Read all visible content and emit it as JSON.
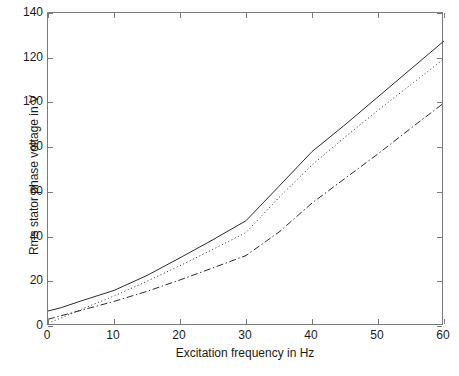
{
  "chart_data": {
    "type": "line",
    "title": "",
    "xlabel": "Excitation frequency in Hz",
    "ylabel": "Rms stator phase voltage in V",
    "xlim": [
      0,
      60
    ],
    "ylim": [
      0,
      140
    ],
    "xticks": [
      0,
      10,
      20,
      30,
      40,
      50,
      60
    ],
    "yticks": [
      0,
      20,
      40,
      60,
      80,
      100,
      120,
      140
    ],
    "grid": false,
    "legend": "none",
    "x": [
      0,
      2,
      5,
      10,
      15,
      20,
      25,
      30,
      35,
      40,
      45,
      50,
      55,
      60
    ],
    "series": [
      {
        "name": "curve-solid",
        "style": "solid",
        "color": "#2b2b2b",
        "values": [
          6.7,
          8.2,
          11.2,
          15.9,
          22.6,
          30.5,
          38.6,
          47.1,
          62.5,
          78.0,
          90.0,
          102.5,
          115.0,
          127.5
        ]
      },
      {
        "name": "curve-dotted",
        "style": "dotted",
        "color": "#2b2b2b",
        "values": [
          1.3,
          3.6,
          7.4,
          13.4,
          20.0,
          27.0,
          34.3,
          41.8,
          57.5,
          72.0,
          84.5,
          96.5,
          108.0,
          119.5
        ]
      },
      {
        "name": "curve-dashdot",
        "style": "dashdot",
        "color": "#2b2b2b",
        "values": [
          3.0,
          4.6,
          7.0,
          11.0,
          15.5,
          20.6,
          26.0,
          31.5,
          42.0,
          55.0,
          66.0,
          77.0,
          88.5,
          99.8
        ]
      }
    ]
  },
  "axes": {
    "xtick_labels": [
      "0",
      "10",
      "20",
      "30",
      "40",
      "50",
      "60"
    ],
    "ytick_labels": [
      "0",
      "20",
      "40",
      "60",
      "80",
      "100",
      "120",
      "140"
    ],
    "xlabel": "Excitation frequency in Hz",
    "ylabel": "Rms stator phase voltage in V"
  },
  "style": {
    "axis_color": "#7a7a7a",
    "line_color": "#2b2b2b",
    "background": "#ffffff"
  }
}
